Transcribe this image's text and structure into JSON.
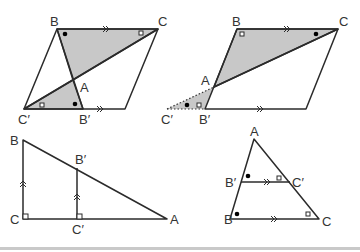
{
  "figures": {
    "fig1": {
      "labels": {
        "B": "B",
        "C": "C",
        "A": "A",
        "Cp": "C′",
        "Bp": "B′"
      },
      "description": "Parallelogram with shaded triangles ABC and AB′C′ sharing vertex A"
    },
    "fig2": {
      "labels": {
        "B": "B",
        "C": "C",
        "A": "A",
        "Cp": "C′",
        "Bp": "B′"
      },
      "description": "Parallelogram with shaded triangle ABC and dotted triangle AB′C′ outside"
    },
    "fig3": {
      "labels": {
        "B": "B",
        "C": "C",
        "A": "A",
        "Bp": "B′",
        "Cp": "C′"
      },
      "description": "Right triangle ABC with parallel segment B′C′"
    },
    "fig4": {
      "labels": {
        "A": "A",
        "B": "B",
        "C": "C",
        "Bp": "B′",
        "Cp": "C′"
      },
      "description": "Triangle ABC with B′C′ parallel to BC"
    }
  },
  "colors": {
    "shade": "#c8c8c8",
    "line": "#2b2b2b",
    "divider": "#c9c9c9"
  }
}
